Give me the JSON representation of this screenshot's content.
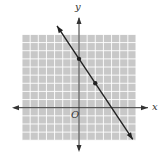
{
  "chart_data": {
    "type": "line",
    "title": "",
    "xlabel": "x",
    "ylabel": "y",
    "origin_label": "O",
    "xlim": [
      -7,
      7
    ],
    "ylim": [
      -4,
      9
    ],
    "grid": true,
    "grid_step": 1,
    "legend": null,
    "series": [
      {
        "name": "line",
        "equation": "y = -3/2 x + 6",
        "slope": -1.5,
        "intercept": 6,
        "arrows": "both",
        "points": [
          {
            "x": 0,
            "y": 6
          },
          {
            "x": 2,
            "y": 3
          }
        ],
        "x_range": [
          -2.7,
          6.6
        ]
      }
    ]
  },
  "labels": {
    "x_axis": "x",
    "y_axis": "y",
    "origin": "O"
  },
  "colors": {
    "grid_bg": "#c8c8c8",
    "grid_line": "#ffffff",
    "axis": "#333333",
    "line": "#222222"
  }
}
